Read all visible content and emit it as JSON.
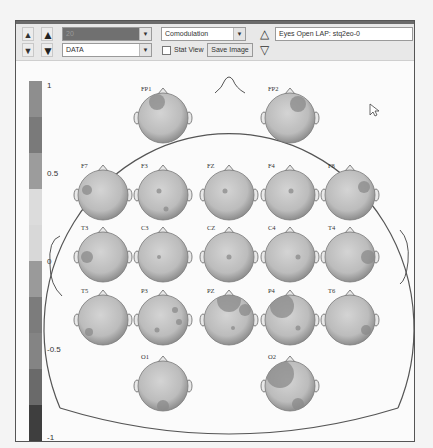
{
  "toolbar": {
    "left_spin_up": "▲",
    "left_spin_down": "▼",
    "big_spin_up": "▲",
    "big_spin_down": "▼",
    "selector_top": {
      "value": "20",
      "arrow": "▼"
    },
    "selector_bottom": {
      "value": "DATA",
      "arrow": "▼"
    },
    "measure_combo": {
      "value": "Comodulation",
      "arrow": "▼"
    },
    "stat_view_label": "Stat View",
    "stat_view_checked": false,
    "save_image_label": "Save Image",
    "nav_up": "△",
    "nav_down": "▽",
    "info_text": "Eyes Open LAP: stq2eo-0"
  },
  "colorbar": {
    "labels": [
      {
        "text": "1",
        "pos": 0
      },
      {
        "text": "0.5",
        "pos": 0.25
      },
      {
        "text": "0",
        "pos": 0.5
      },
      {
        "text": "-0.5",
        "pos": 0.75
      },
      {
        "text": "-1",
        "pos": 1
      }
    ],
    "segments": [
      "#8e8e8e",
      "#7a7a7a",
      "#9c9c9c",
      "#dcdcdc",
      "#d8d8d8",
      "#9a9a9a",
      "#7c7c7c",
      "#848484",
      "#6a6a6a",
      "#3e3e3e"
    ]
  },
  "electrodes": [
    {
      "name": "FP1",
      "x": 163,
      "y": 118,
      "spots": [
        {
          "dx": -6,
          "dy": -16,
          "r": 8
        }
      ]
    },
    {
      "name": "FP2",
      "x": 290,
      "y": 118,
      "spots": [
        {
          "dx": 8,
          "dy": -14,
          "r": 8
        }
      ]
    },
    {
      "name": "F7",
      "x": 103,
      "y": 195,
      "spots": [
        {
          "dx": -16,
          "dy": -5,
          "r": 5
        }
      ]
    },
    {
      "name": "F3",
      "x": 163,
      "y": 195,
      "spots": [
        {
          "dx": -4,
          "dy": -4,
          "r": 2.5
        },
        {
          "dx": 3,
          "dy": 14,
          "r": 2.5
        }
      ]
    },
    {
      "name": "FZ",
      "x": 229,
      "y": 195,
      "spots": [
        {
          "dx": -4,
          "dy": -4,
          "r": 2.5
        }
      ]
    },
    {
      "name": "F4",
      "x": 290,
      "y": 195,
      "spots": [
        {
          "dx": 1,
          "dy": -4,
          "r": 2.5
        }
      ]
    },
    {
      "name": "F8",
      "x": 350,
      "y": 195,
      "spots": [
        {
          "dx": 14,
          "dy": -8,
          "r": 6
        }
      ]
    },
    {
      "name": "T3",
      "x": 103,
      "y": 257,
      "spots": [
        {
          "dx": -16,
          "dy": 0,
          "r": 6
        }
      ]
    },
    {
      "name": "C3",
      "x": 163,
      "y": 257,
      "spots": [
        {
          "dx": -4,
          "dy": 0,
          "r": 2
        }
      ]
    },
    {
      "name": "CZ",
      "x": 229,
      "y": 257,
      "spots": [
        {
          "dx": 0,
          "dy": 0,
          "r": 2.5
        }
      ]
    },
    {
      "name": "C4",
      "x": 290,
      "y": 257,
      "spots": [
        {
          "dx": 8,
          "dy": 0,
          "r": 2.5
        }
      ]
    },
    {
      "name": "T4",
      "x": 350,
      "y": 257,
      "spots": [
        {
          "dx": 18,
          "dy": 0,
          "r": 7
        }
      ]
    },
    {
      "name": "T5",
      "x": 103,
      "y": 320,
      "spots": [
        {
          "dx": -14,
          "dy": 12,
          "r": 4
        }
      ]
    },
    {
      "name": "P3",
      "x": 163,
      "y": 320,
      "spots": [
        {
          "dx": 12,
          "dy": -10,
          "r": 3
        },
        {
          "dx": 16,
          "dy": 2,
          "r": 3
        },
        {
          "dx": -6,
          "dy": 10,
          "r": 2.5
        }
      ]
    },
    {
      "name": "PZ",
      "x": 229,
      "y": 320,
      "spots": [
        {
          "dx": 0,
          "dy": -20,
          "r": 12
        },
        {
          "dx": 16,
          "dy": -10,
          "r": 6
        },
        {
          "dx": 4,
          "dy": 8,
          "r": 2
        }
      ]
    },
    {
      "name": "P4",
      "x": 290,
      "y": 320,
      "spots": [
        {
          "dx": -8,
          "dy": -14,
          "r": 12
        },
        {
          "dx": 8,
          "dy": 8,
          "r": 2.5
        }
      ]
    },
    {
      "name": "T6",
      "x": 350,
      "y": 320,
      "spots": [
        {
          "dx": 16,
          "dy": 10,
          "r": 5
        }
      ]
    },
    {
      "name": "O1",
      "x": 163,
      "y": 386,
      "spots": [
        {
          "dx": 0,
          "dy": 20,
          "r": 6
        }
      ]
    },
    {
      "name": "O2",
      "x": 290,
      "y": 386,
      "spots": [
        {
          "dx": -10,
          "dy": -12,
          "r": 14
        },
        {
          "dx": 8,
          "dy": 18,
          "r": 6
        }
      ]
    }
  ],
  "cursor": {
    "x": 370,
    "y": 104
  }
}
